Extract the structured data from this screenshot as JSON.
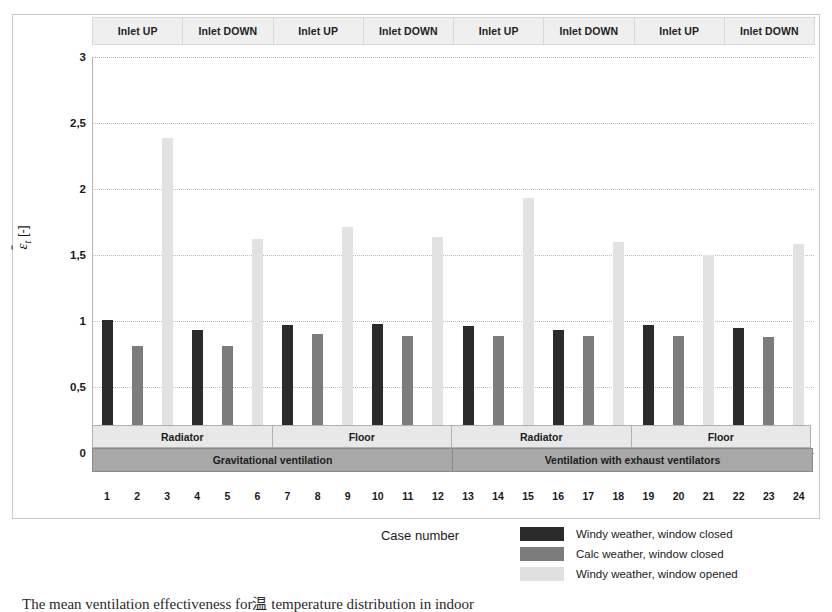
{
  "chart_data": {
    "type": "bar",
    "title": "",
    "xlabel": "Case number",
    "ylabel": "ε̄ₜ [-]",
    "ylim": [
      0,
      3
    ],
    "yticks": [
      "0",
      "0,5",
      "1",
      "1,5",
      "2",
      "2,5",
      "3"
    ],
    "ytick_values": [
      0,
      0.5,
      1,
      1.5,
      2,
      2.5,
      3
    ],
    "grid": true,
    "legend_position": "bottom-right",
    "categories": [
      "1",
      "2",
      "3",
      "4",
      "5",
      "6",
      "7",
      "8",
      "9",
      "10",
      "11",
      "12",
      "13",
      "14",
      "15",
      "16",
      "17",
      "18",
      "19",
      "20",
      "21",
      "22",
      "23",
      "24"
    ],
    "series": [
      {
        "name": "Windy weather, window closed",
        "color": "#2b2b2b",
        "values": [
          1.01,
          null,
          null,
          0.93,
          null,
          null,
          0.97,
          null,
          null,
          0.98,
          null,
          null,
          0.96,
          null,
          null,
          0.93,
          null,
          null,
          0.97,
          null,
          null,
          0.95,
          null,
          null
        ]
      },
      {
        "name": "Calc weather, window closed",
        "color": "#7c7c7c",
        "values": [
          null,
          0.81,
          null,
          null,
          0.81,
          null,
          null,
          0.9,
          null,
          null,
          0.89,
          null,
          null,
          0.89,
          null,
          null,
          0.89,
          null,
          null,
          0.89,
          null,
          null,
          0.88,
          null
        ]
      },
      {
        "name": "Windy weather, window opened",
        "color": "#e2e2e2",
        "values": [
          null,
          null,
          2.39,
          null,
          null,
          1.62,
          null,
          null,
          1.71,
          null,
          null,
          1.64,
          null,
          null,
          1.93,
          null,
          null,
          1.6,
          null,
          null,
          1.5,
          null,
          null,
          1.58
        ]
      }
    ],
    "bar_values": [
      1.01,
      0.81,
      2.39,
      0.93,
      0.81,
      1.62,
      0.97,
      0.9,
      1.71,
      0.98,
      0.89,
      1.64,
      0.96,
      0.89,
      1.93,
      0.93,
      0.89,
      1.6,
      0.97,
      0.89,
      1.5,
      0.95,
      0.88,
      1.58
    ],
    "bar_series_index": [
      0,
      1,
      2,
      0,
      1,
      2,
      0,
      1,
      2,
      0,
      1,
      2,
      0,
      1,
      2,
      0,
      1,
      2,
      0,
      1,
      2,
      0,
      1,
      2
    ]
  },
  "top_band": {
    "cells": [
      {
        "label": "Inlet UP"
      },
      {
        "label": "Inlet DOWN"
      },
      {
        "label": "Inlet UP"
      },
      {
        "label": "Inlet DOWN"
      },
      {
        "label": "Inlet UP"
      },
      {
        "label": "Inlet DOWN"
      },
      {
        "label": "Inlet UP"
      },
      {
        "label": "Inlet DOWN"
      }
    ]
  },
  "heating_band": {
    "cells": [
      {
        "label": "Radiator",
        "span": 6
      },
      {
        "label": "Floor",
        "span": 6
      },
      {
        "label": "Radiator",
        "span": 6
      },
      {
        "label": "Floor",
        "span": 6
      }
    ]
  },
  "ventilation_band": {
    "cells": [
      {
        "label": "Gravitational ventilation",
        "span": 12
      },
      {
        "label": "Ventilation with exhaust ventilators",
        "span": 12
      }
    ]
  },
  "legend": {
    "items": [
      {
        "label": "Windy weather, window closed",
        "color": "#2b2b2b"
      },
      {
        "label": "Calc weather, window closed",
        "color": "#7c7c7c"
      },
      {
        "label": "Windy weather, window opened",
        "color": "#e0e0e0"
      }
    ]
  },
  "axis": {
    "x_title": "Case number",
    "y_symbol": "ε",
    "y_sub": "t",
    "y_unit": "[-]"
  },
  "caption": {
    "text": "The mean ventilation effectiveness for温 temperature distribution in indoor"
  }
}
